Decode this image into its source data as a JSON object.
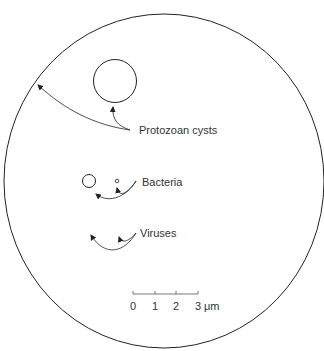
{
  "diagram": {
    "title": "",
    "field_of_view": {
      "shape": "circle",
      "stroke": "#222222"
    },
    "labels": {
      "protozoan": "Protozoan cysts",
      "bacteria": "Bacteria",
      "viruses": "Viruses"
    },
    "scale_bar": {
      "ticks": [
        "0",
        "1",
        "2",
        "3"
      ],
      "unit": "μm"
    },
    "colors": {
      "stroke": "#222222",
      "text": "#333333",
      "background": "#ffffff"
    }
  }
}
